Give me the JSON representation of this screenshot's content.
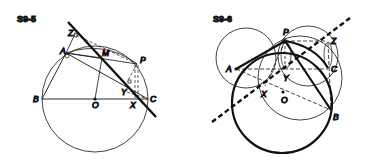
{
  "figures": [
    {
      "id": "S9-5",
      "title": "S9-5",
      "points": {
        "Z": "Z",
        "A": "A",
        "M": "M",
        "P": "P",
        "B": "B",
        "O": "O",
        "Y": "Y",
        "X": "X",
        "C": "C"
      },
      "description": "Circle with diameter BC, center O; Simson line (thick) through Z, Y, X from point P"
    },
    {
      "id": "S9-6",
      "title": "S9-6",
      "points": {
        "P": "P",
        "Z": "Z",
        "A": "A",
        "C": "C",
        "Y": "Y",
        "X": "X",
        "O": "O",
        "B": "B"
      },
      "description": "Circumcircle (thick) of triangle ABC with point P; auxiliary circles; dashed Simson line through X, Y, Z"
    }
  ]
}
